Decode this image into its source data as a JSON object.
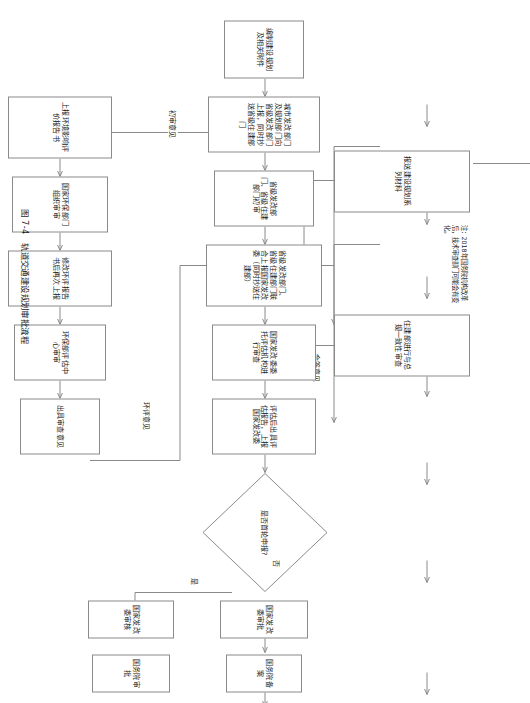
{
  "figure": {
    "caption": "图 7-4　轨道交通建设规划审批流程",
    "note": "注：2018年国务院机构改革后，技术审查部门可能会有变化。"
  },
  "main_flow": {
    "nodes": [
      {
        "id": "n1",
        "label": "编制建设规划及相关附件"
      },
      {
        "id": "n2",
        "label": "城市发改部门及规划部门向省级发改部门上报，同时抄送省级住建部门"
      },
      {
        "id": "n3",
        "label": "省级发改部门、省级住建部门初审"
      },
      {
        "id": "n4",
        "label": "省级发改部门、省级住建部门联合上报国家发改委（同时抄送住建部）"
      },
      {
        "id": "n5",
        "label": "国家发改委委托评估机构进行审查"
      },
      {
        "id": "n6",
        "label": "评估后出具评估报告，上报国家发改委"
      }
    ]
  },
  "decision": {
    "label": "是否首轮申报?",
    "branch_no": "否",
    "branch_yes": "是"
  },
  "no_branch": {
    "nodes": [
      {
        "id": "b1",
        "label": "国家发改委审批"
      },
      {
        "id": "b2",
        "label": "国务院备案"
      },
      {
        "id": "b3",
        "label": "完成立项"
      }
    ]
  },
  "yes_branch": {
    "nodes": [
      {
        "id": "y1",
        "label": "国家发改委审核"
      },
      {
        "id": "y2",
        "label": "国务院审批"
      }
    ]
  },
  "top_review": {
    "nodes": [
      {
        "id": "t1",
        "label": "报送建设规划系列材料"
      },
      {
        "id": "t2",
        "label": "住建部进行与总规一致性审查"
      }
    ],
    "edge_label": "会签意见"
  },
  "eia_flow": {
    "nodes": [
      {
        "id": "e1",
        "label": "上报环境影响评价报告书"
      },
      {
        "id": "e2",
        "label": "国家环保部门组织审审"
      },
      {
        "id": "e3",
        "label": "修改环评报告书后再次上报"
      },
      {
        "id": "e4",
        "label": "环保部评估中心审审"
      },
      {
        "id": "e5",
        "label": "出具审查意见"
      }
    ]
  },
  "edge_labels": {
    "first_review": "初审意见",
    "eia_opinion": "环评意见"
  },
  "colors": {
    "stroke": "#8a8a8a",
    "text": "#1a1a1a",
    "background": "#ffffff"
  }
}
